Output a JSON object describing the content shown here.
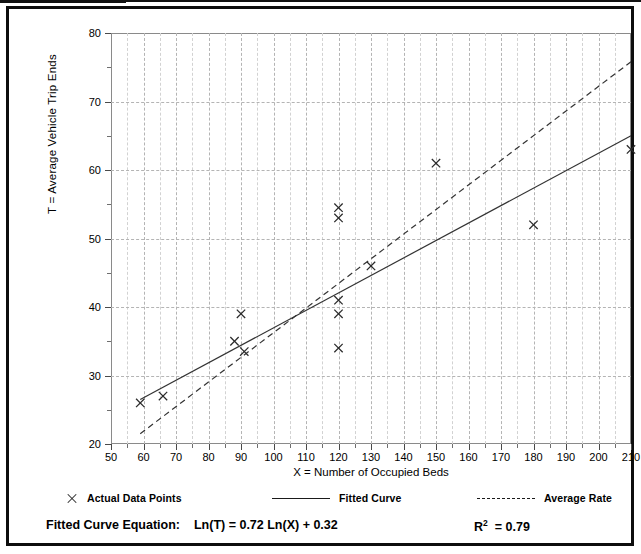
{
  "figure": {
    "frame_color": "#0d0d0d",
    "background": "#ffffff"
  },
  "chart_data": {
    "type": "scatter",
    "title": "",
    "xlabel": "X = Number of Occupied Beds",
    "ylabel": "T = Average Vehicle Trip Ends",
    "xlim": [
      50,
      210
    ],
    "ylim": [
      20,
      80
    ],
    "xticks": [
      50,
      60,
      70,
      80,
      90,
      100,
      110,
      120,
      130,
      140,
      150,
      160,
      170,
      180,
      190,
      200,
      210
    ],
    "yticks": [
      20,
      30,
      40,
      50,
      60,
      70,
      80
    ],
    "xminor_step": 5,
    "yminor_step": 5,
    "grid": "dashed-both-axes",
    "legend_position": "below-axes",
    "series": [
      {
        "name": "Actual Data Points",
        "type": "scatter",
        "marker": "x",
        "points": [
          [
            59,
            26
          ],
          [
            66,
            27
          ],
          [
            88,
            35
          ],
          [
            90,
            39
          ],
          [
            91,
            33.5
          ],
          [
            120,
            54.5
          ],
          [
            120,
            53
          ],
          [
            120,
            41
          ],
          [
            120,
            39
          ],
          [
            120,
            34
          ],
          [
            130,
            46
          ],
          [
            150,
            61
          ],
          [
            180,
            52
          ],
          [
            210,
            63
          ]
        ]
      },
      {
        "name": "Fitted Curve",
        "type": "line",
        "style": "solid",
        "equation": "Ln(T) = 0.72 Ln(X) + 0.32",
        "endpoints": [
          [
            59,
            26.5
          ],
          [
            210,
            65
          ]
        ]
      },
      {
        "name": "Average Rate",
        "type": "line",
        "style": "dashed",
        "endpoints": [
          [
            59,
            21.5
          ],
          [
            210,
            75.8
          ]
        ]
      }
    ]
  },
  "legend": {
    "items": [
      {
        "label": "Actual Data Points",
        "marker": "x-marker"
      },
      {
        "label": "Fitted Curve",
        "marker": "solid-line"
      },
      {
        "label": "Average Rate",
        "marker": "dashed-line"
      }
    ]
  },
  "footer": {
    "equation_label": "Fitted Curve Equation:",
    "equation_value": "Ln(T) = 0.72 Ln(X) + 0.32",
    "r_squared_symbol": "R",
    "r_squared_exponent": "2",
    "r_squared_value": "= 0.79"
  }
}
